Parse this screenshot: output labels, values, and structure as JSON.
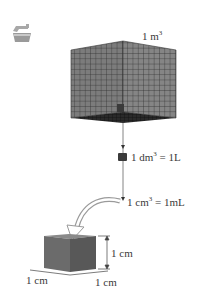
{
  "diagram": {
    "icon": "laboratory-sink-icon",
    "cubes": [
      {
        "id": "cube-1m3",
        "label_base": "1 m",
        "label_exp": "3"
      },
      {
        "id": "cube-1dm3",
        "label_base": "1 dm",
        "label_exp": "3",
        "label_suffix": " = 1L"
      },
      {
        "id": "cube-1cm3",
        "label_base": "1 cm",
        "label_exp": "3",
        "label_suffix": " = 1mL"
      }
    ],
    "dimensions": {
      "height": "1 cm",
      "width_left": "1 cm",
      "width_right": "1 cm"
    },
    "colors": {
      "grid_face": "#7a7a7a",
      "grid_lines": "#2a2a2a",
      "small_cube_left": "#6b6b6b",
      "small_cube_right": "#5a5a5a",
      "small_cube_top": "#8a8a8a",
      "arrow": "#9a9a9a"
    }
  }
}
